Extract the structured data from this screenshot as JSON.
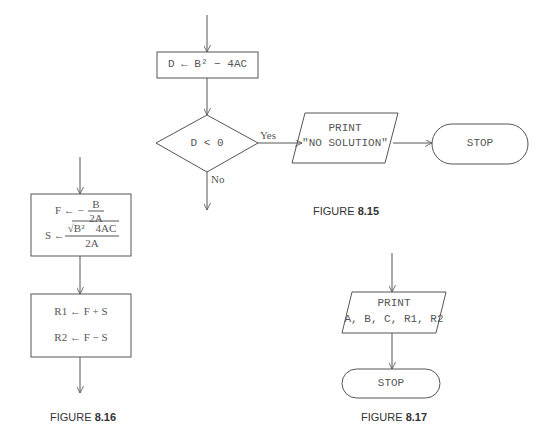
{
  "figure_8_15": {
    "caption_prefix": "FIGURE ",
    "caption_number": "8.15",
    "assign_box": "D ← B² − 4AC",
    "decision": "D < 0",
    "yes_label": "Yes",
    "no_label": "No",
    "print_line1": "PRINT",
    "print_line2": "\"NO SOLUTION\"",
    "stop": "STOP"
  },
  "figure_8_16": {
    "caption_prefix": "FIGURE ",
    "caption_number": "8.16",
    "f_lhs": "F ←  −",
    "f_num": "B",
    "f_den": "2A",
    "s_lhs": "S ←",
    "s_num": "√B²    4AC",
    "s_den": "2A",
    "r1": "R1 ← F + S",
    "r2": "R2 ← F − S"
  },
  "figure_8_17": {
    "caption_prefix": "FIGURE ",
    "caption_number": "8.17",
    "print_line1": "PRINT",
    "print_line2": "A, B, C, R1, R2",
    "stop": "STOP"
  },
  "colors": {
    "line": "#555555",
    "text": "#555555",
    "caption": "#333333"
  }
}
